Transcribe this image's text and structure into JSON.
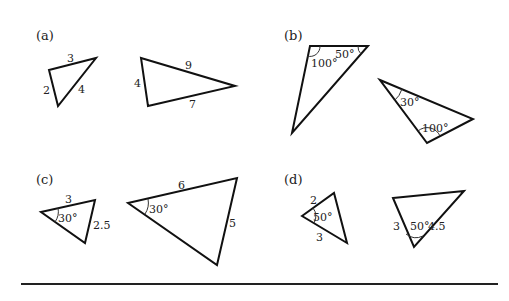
{
  "figure": {
    "panels": [
      {
        "id": "a",
        "label": "(a)",
        "triangles": [
          {
            "sides": [
              "3",
              "4",
              "2"
            ],
            "angles": []
          },
          {
            "sides": [
              "9",
              "7",
              "4"
            ],
            "angles": []
          }
        ]
      },
      {
        "id": "b",
        "label": "(b)",
        "triangles": [
          {
            "sides": [],
            "angles": [
              "100°",
              "50°"
            ]
          },
          {
            "sides": [],
            "angles": [
              "30°",
              "100°"
            ]
          }
        ]
      },
      {
        "id": "c",
        "label": "(c)",
        "triangles": [
          {
            "sides": [
              "3",
              "2.5"
            ],
            "angles": [
              "30°"
            ]
          },
          {
            "sides": [
              "6",
              "5"
            ],
            "angles": [
              "30°"
            ]
          }
        ]
      },
      {
        "id": "d",
        "label": "(d)",
        "triangles": [
          {
            "sides": [
              "2",
              "3"
            ],
            "angles": [
              "50°"
            ]
          },
          {
            "sides": [
              "3",
              "4.5"
            ],
            "angles": [
              "50°"
            ]
          }
        ]
      }
    ],
    "colors": {
      "stroke": "#111111",
      "text": "#222222",
      "background": "#ffffff"
    }
  }
}
